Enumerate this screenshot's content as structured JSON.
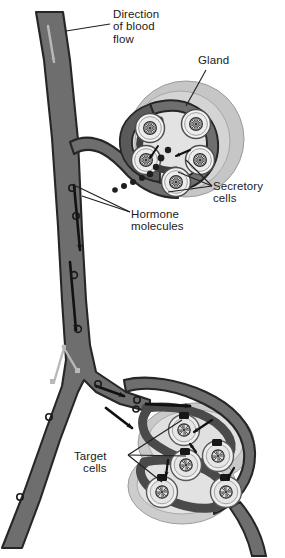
{
  "figure": {
    "domain": "biology-diagram",
    "style": "grayscale textbook line illustration"
  },
  "labels": {
    "direction": "Direction\nof blood\nflow",
    "gland": "Gland",
    "secretory": "Secretory\ncells",
    "hormone": "Hormone\nmolecules",
    "target": "Target\ncells"
  },
  "colors": {
    "background": "#ffffff",
    "text": "#1a1a1a",
    "vessel_fill": "#6e6e6e",
    "vessel_outline": "#2b2b2b",
    "vessel_inner_dark": "#4a4a4a",
    "gland_outer": "#c9c9c9",
    "gland_mid": "#d6d6d6",
    "gland_inner": "#e4e4e4",
    "cell_fill": "#f2f2f2",
    "cell_outline": "#555555",
    "nucleus_fill": "#e8e8e8",
    "nucleus_outline": "#3a3a3a",
    "arrow": "#111111",
    "valve": "#b8b8b8",
    "hormone_dot": "#1e1e1e",
    "leader_line": "#222222"
  },
  "structures": {
    "blood_vessel": {
      "name": "blood vessel",
      "flow_direction": "downward",
      "branches": 2
    },
    "gland": {
      "name": "gland",
      "position": "upper right",
      "secretory_cell_count": 5,
      "ring_layers": 3
    },
    "target_organ": {
      "name": "target tissue",
      "position": "lower right",
      "target_cell_count": 5,
      "lobes": 2,
      "receptor_count": 5
    },
    "hormone_molecules": {
      "name": "hormone molecules",
      "visible_count": 14,
      "shape": "small open circle"
    }
  },
  "arrows": {
    "blood_flow_upper": "downward inside vessel",
    "blood_flow_lower": "rightward into target tissue",
    "secretion": "from secretory cells into vessel",
    "reception": "from vessel to target cell receptors"
  }
}
